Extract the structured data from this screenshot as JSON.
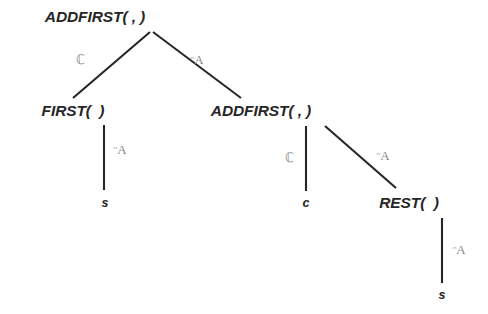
{
  "figure": {
    "name": "addfirst-derivation-tree",
    "ink_color": "#262626",
    "label_color": "#8a8a8a",
    "background_color": "#ffffff"
  },
  "nodes": [
    {
      "id": "root",
      "label": "ADDFIRST( , )",
      "kind": "internal",
      "x": 95,
      "y": 17
    },
    {
      "id": "first",
      "label": "FIRST(  )",
      "kind": "internal",
      "x": 73,
      "y": 111
    },
    {
      "id": "addfirst2",
      "label": "ADDFIRST( , )",
      "kind": "internal",
      "x": 261,
      "y": 111
    },
    {
      "id": "s-left",
      "label": "s",
      "kind": "leaf",
      "x": 105,
      "y": 203
    },
    {
      "id": "c-mid",
      "label": "c",
      "kind": "leaf",
      "x": 306,
      "y": 203
    },
    {
      "id": "rest",
      "label": "REST(  )",
      "kind": "internal",
      "x": 409,
      "y": 203
    },
    {
      "id": "s-bottom",
      "label": "s",
      "kind": "leaf",
      "x": 442,
      "y": 295
    }
  ],
  "edges": [
    {
      "id": "root-first",
      "from": "root",
      "to": "first",
      "x1": 150,
      "y1": 32,
      "x2": 73,
      "y2": 98
    },
    {
      "id": "root-addfirst2",
      "from": "root",
      "to": "addfirst2",
      "x1": 153,
      "y1": 32,
      "x2": 241,
      "y2": 98
    },
    {
      "id": "first-s",
      "from": "first",
      "to": "s-left",
      "x1": 104,
      "y1": 125,
      "x2": 104,
      "y2": 190
    },
    {
      "id": "addfirst2-c",
      "from": "addfirst2",
      "to": "c-mid",
      "x1": 306,
      "y1": 126,
      "x2": 306,
      "y2": 191
    },
    {
      "id": "addfirst2-rest",
      "from": "addfirst2",
      "to": "rest",
      "x1": 325,
      "y1": 126,
      "x2": 396,
      "y2": 188
    },
    {
      "id": "rest-s",
      "from": "rest",
      "to": "s-bottom",
      "x1": 442,
      "y1": 218,
      "x2": 442,
      "y2": 283
    }
  ],
  "edge_labels": [
    {
      "id": "label-root-left",
      "text": "ℂ",
      "edge": "root-first",
      "x": 80,
      "y": 60
    },
    {
      "id": "label-root-right",
      "text": "ᵔA",
      "edge": "root-addfirst2",
      "x": 197,
      "y": 60
    },
    {
      "id": "label-first-s",
      "text": "ᵔA",
      "edge": "first-s",
      "x": 120,
      "y": 150
    },
    {
      "id": "label-addfirst2-c",
      "text": "ℂ",
      "edge": "addfirst2-c",
      "x": 289,
      "y": 158
    },
    {
      "id": "label-addfirst2-rest",
      "text": "ᵔA",
      "edge": "addfirst2-rest",
      "x": 383,
      "y": 156
    },
    {
      "id": "label-rest-s",
      "text": "ᵔA",
      "edge": "rest-s",
      "x": 459,
      "y": 250
    }
  ]
}
